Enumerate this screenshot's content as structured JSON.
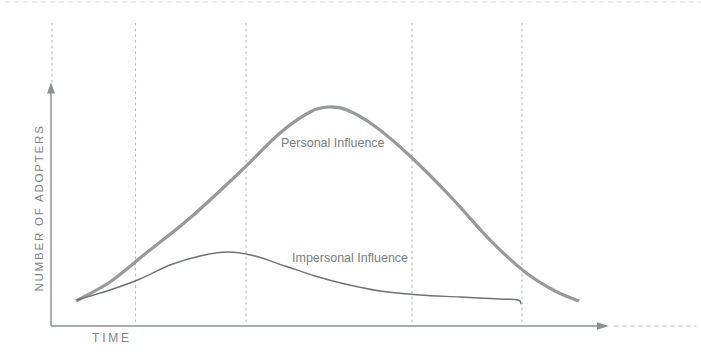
{
  "chart_data": {
    "type": "line",
    "title": "",
    "xlabel": "TIME",
    "ylabel": "NUMBER OF ADOPTERS",
    "axes_numeric": false,
    "grid": "vertical dashed gridlines only",
    "legend": "inline text annotations next to each curve",
    "x_axis_style": "solid line with right-pointing arrowhead, then dashed continuation to right edge",
    "y_axis_style": "solid line with up-pointing arrowhead, dashed continuation above arrow",
    "gridlines": [
      {
        "x": 52,
        "y1": 23,
        "y2": 84
      },
      {
        "x": 135.5,
        "y1": 23,
        "y2": 325
      },
      {
        "x": 246,
        "y1": 23,
        "y2": 325
      },
      {
        "x": 412,
        "y1": 23,
        "y2": 325
      },
      {
        "x": 522,
        "y1": 23,
        "y2": 325
      }
    ],
    "series": [
      {
        "id": "personal",
        "name": "Personal Influence",
        "shape": "tall wide bell curve peaking mid-timeline",
        "color": "#97999b",
        "stroke_width": 3.2,
        "points_px": [
          [
            76,
            301
          ],
          [
            110,
            282
          ],
          [
            145,
            254
          ],
          [
            190,
            218
          ],
          [
            240,
            172
          ],
          [
            280,
            133
          ],
          [
            310,
            112
          ],
          [
            328,
            107
          ],
          [
            347,
            110
          ],
          [
            376,
            127
          ],
          [
            410,
            156
          ],
          [
            450,
            196
          ],
          [
            490,
            240
          ],
          [
            525,
            272
          ],
          [
            555,
            291
          ],
          [
            579,
            301
          ]
        ]
      },
      {
        "id": "impersonal",
        "name": "Impersonal Influence",
        "shape": "low early bump peaking before personal curve, long flat declining tail ending at fourth gridline",
        "color": "#6f7273",
        "stroke_width": 1.4,
        "points_px": [
          [
            77,
            300
          ],
          [
            110,
            290
          ],
          [
            140,
            279
          ],
          [
            170,
            265
          ],
          [
            200,
            256
          ],
          [
            228,
            252
          ],
          [
            255,
            256
          ],
          [
            285,
            266
          ],
          [
            315,
            276
          ],
          [
            345,
            284
          ],
          [
            380,
            291
          ],
          [
            420,
            295
          ],
          [
            460,
            297
          ],
          [
            500,
            299
          ],
          [
            518,
            300
          ],
          [
            521,
            304
          ]
        ]
      }
    ]
  },
  "colors": {
    "background": "#ffffff",
    "axis": "#8b8f90",
    "gridline": "#b6bcbc",
    "personal_curve": "#97999b",
    "impersonal_curve": "#6f7273",
    "label_text": "#7f8486"
  }
}
